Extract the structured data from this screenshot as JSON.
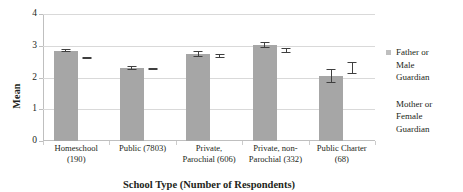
{
  "chart_data": {
    "type": "bar",
    "title": "",
    "xlabel": "School Type (Number of Respondents)",
    "ylabel": "Mean",
    "ylim": [
      0,
      4
    ],
    "yticks": [
      0,
      1,
      2,
      3,
      4
    ],
    "ytick_labels": [
      "0",
      "1",
      "2",
      "3",
      "4"
    ],
    "grid": true,
    "legend_position": "right",
    "categories": [
      "Homeschool (190)",
      "Public (7803)",
      "Private, Parochial (606)",
      "Private, non-Parochial (332)",
      "Public Charter (68)"
    ],
    "category_lines": [
      [
        "Homeschool",
        "(190)"
      ],
      [
        "Public (7803)",
        ""
      ],
      [
        "Private,",
        "Parochial (606)"
      ],
      [
        "Private, non-",
        "Parochial (332)"
      ],
      [
        "Public Charter",
        "(68)"
      ]
    ],
    "series": [
      {
        "name": "Father or Male Guardian",
        "style": "bar",
        "color": "#a6a6a6",
        "values": [
          2.85,
          2.3,
          2.73,
          3.02,
          2.05
        ],
        "errors": [
          0.04,
          0.05,
          0.09,
          0.1,
          0.22
        ]
      },
      {
        "name": "Mother or Female Guardian",
        "style": "marker-errorbar",
        "color": "#3f3f3f",
        "values": [
          2.6,
          2.27,
          2.67,
          2.85,
          2.3
        ],
        "errors": [
          0.03,
          0.04,
          0.07,
          0.07,
          0.18
        ]
      }
    ]
  },
  "legend": {
    "items": [
      {
        "label_lines": [
          "Father or",
          "Male",
          "Guardian"
        ],
        "swatch": "#bfbfbf"
      },
      {
        "label_lines": [
          "Mother or",
          "Female",
          "Guardian"
        ],
        "swatch": "#3f3f3f"
      }
    ]
  }
}
